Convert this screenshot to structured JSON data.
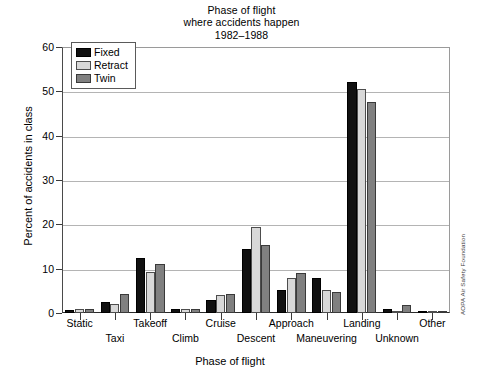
{
  "chart_data": {
    "type": "bar",
    "title": "Phase of flight\nwhere accidents happen\n1982–1988",
    "title_lines": [
      "Phase of flight",
      "where accidents happen",
      "1982–1988"
    ],
    "xlabel": "Phase of flight",
    "ylabel": "Percent of accidents in class",
    "ylim": [
      0,
      60
    ],
    "yticks": [
      0,
      10,
      20,
      30,
      40,
      50,
      60
    ],
    "ytick_labels": [
      "0",
      "10",
      "20",
      "30",
      "40",
      "50",
      "60"
    ],
    "grid": "horizontal",
    "legend_position": "upper-left inside",
    "categories": [
      "Static",
      "Taxi",
      "Takeoff",
      "Climb",
      "Cruise",
      "Descent",
      "Approach",
      "Maneuvering",
      "Landing",
      "Unknown",
      "Other"
    ],
    "series": [
      {
        "name": "Fixed",
        "color": "#111111",
        "values": [
          0.7,
          2.5,
          12.3,
          1.0,
          3.0,
          14.5,
          5.2,
          8.0,
          52.0,
          1.0,
          0.1
        ]
      },
      {
        "name": "Retract",
        "color": "#d8d8d8",
        "values": [
          1.0,
          2.0,
          9.2,
          0.8,
          4.0,
          19.5,
          8.0,
          5.3,
          50.5,
          0.2,
          0.0
        ]
      },
      {
        "name": "Twin",
        "color": "#808080",
        "values": [
          1.0,
          4.2,
          11.0,
          0.8,
          4.3,
          15.3,
          9.0,
          4.7,
          47.5,
          1.7,
          0.2
        ]
      }
    ],
    "annotation": "AOPA Air Safety Foundation"
  },
  "legend": {
    "items": [
      {
        "label": "Fixed",
        "swatch": "fixed"
      },
      {
        "label": "Retract",
        "swatch": "retract"
      },
      {
        "label": "Twin",
        "swatch": "twin"
      }
    ]
  }
}
